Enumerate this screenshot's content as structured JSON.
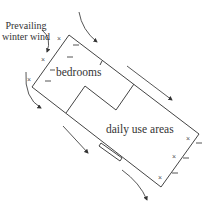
{
  "diagram": {
    "wind_label_line1": "Prevailing",
    "wind_label_line2": "winter wind",
    "rooms": {
      "bedrooms": "bedrooms",
      "daily_use": "daily use areas"
    },
    "colors": {
      "line": "#444444",
      "text": "#333333",
      "background": "#ffffff"
    }
  }
}
